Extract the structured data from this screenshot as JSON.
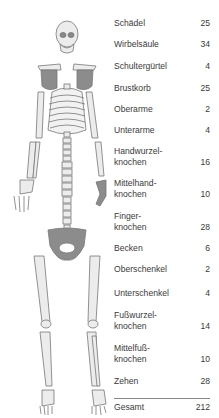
{
  "figure": {
    "type": "skeleton-bone-count",
    "colors": {
      "bone_fill": "#ececec",
      "bone_outline": "#777777",
      "highlight_fill": "#8c8c8c",
      "text": "#3a3a3a",
      "divider": "#888888"
    }
  },
  "table": {
    "rows": [
      {
        "label": "Schädel",
        "value": "25"
      },
      {
        "label": "Wirbelsäule",
        "value": "34"
      },
      {
        "label": "Schultergürtel",
        "value": "4"
      },
      {
        "label": "Brustkorb",
        "value": "25"
      },
      {
        "label": "Oberarme",
        "value": "2"
      },
      {
        "label": "Unterarme",
        "value": "4"
      },
      {
        "label": "Handwurzel-\nknochen",
        "value": "16"
      },
      {
        "label": "Mittelhand-\nknochen",
        "value": "10"
      },
      {
        "label": "Finger-\nknochen",
        "value": "28"
      },
      {
        "label": "Becken",
        "value": "6"
      },
      {
        "label": "Oberschenkel",
        "value": "2"
      },
      {
        "label": "Unterschenkel",
        "value": "4"
      },
      {
        "label": "Fußwurzel-\nknochen",
        "value": "14"
      },
      {
        "label": "Mittelfuß-\nknochen",
        "value": "10"
      },
      {
        "label": "Zehen",
        "value": "28"
      }
    ],
    "total": {
      "label": "Gesamt",
      "value": "212"
    }
  }
}
